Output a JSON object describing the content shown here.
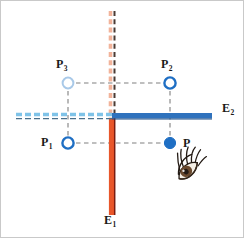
{
  "figure": {
    "background_color": "#ffffff",
    "width": 244,
    "height": 238
  },
  "colors": {
    "mirror_vertical_solid": "#e8562a",
    "mirror_vertical_dashed": "#f2b39a",
    "mirror_vertical_edge": "#7a1c10",
    "mirror_horizontal_solid": "#2f72bd",
    "mirror_horizontal_dashed": "#7fc3e8",
    "point_strong": "#1f6fc4",
    "point_faded": "#a9c9e8",
    "construction_line": "#808080",
    "label_text": "#1a1a1a",
    "eye_iris": "#6b4a2f",
    "eye_lash": "#231a14"
  },
  "mirrors": [
    {
      "id": "E1",
      "label": "E",
      "subscript": "1",
      "orientation": "vertical",
      "solid_segment": "below junction",
      "dashed_extension": "above junction"
    },
    {
      "id": "E2",
      "label": "E",
      "subscript": "2",
      "orientation": "horizontal",
      "solid_segment": "right of junction",
      "dashed_extension": "left of junction"
    }
  ],
  "points": [
    {
      "id": "P",
      "label": "P",
      "subscript": "",
      "style": "filled",
      "color": "#1f6fc4",
      "x": 169,
      "y": 142,
      "label_x": 182,
      "label_y": 136,
      "quadrant": "lower-right (object)"
    },
    {
      "id": "P1",
      "label": "P",
      "subscript": "1",
      "style": "open",
      "color": "#1f6fc4",
      "x": 67,
      "y": 142,
      "label_x": 42,
      "label_y": 136,
      "quadrant": "lower-left"
    },
    {
      "id": "P2",
      "label": "P",
      "subscript": "2",
      "style": "open",
      "color": "#1f6fc4",
      "x": 169,
      "y": 82,
      "label_x": 160,
      "label_y": 59,
      "quadrant": "upper-right"
    },
    {
      "id": "P3",
      "label": "P",
      "subscript": "3",
      "style": "open-faded",
      "color": "#a9c9e8",
      "x": 67,
      "y": 82,
      "label_x": 57,
      "label_y": 59,
      "quadrant": "upper-left"
    }
  ],
  "construction_lines": [
    {
      "from": "P",
      "to": "P1",
      "style": "dashed",
      "orientation": "horizontal"
    },
    {
      "from": "P",
      "to": "P2",
      "style": "dashed",
      "orientation": "vertical"
    },
    {
      "from": "P1",
      "to": "P3",
      "style": "dashed",
      "orientation": "vertical"
    },
    {
      "from": "P3",
      "to": "P2",
      "style": "dashed",
      "orientation": "horizontal"
    }
  ],
  "observer": {
    "id": "eye",
    "icon": "eye-icon",
    "x": 190,
    "y": 172,
    "description": "observer eye looking up-left toward mirrors"
  },
  "labels": {
    "E1": {
      "text": "E",
      "sub": "1",
      "x": 107,
      "y": 219
    },
    "E2": {
      "text": "E",
      "sub": "2",
      "x": 222,
      "y": 106
    },
    "P": {
      "text": "P",
      "sub": "",
      "x": 182,
      "y": 136
    },
    "P1": {
      "text": "P",
      "sub": "1",
      "x": 40,
      "y": 135
    },
    "P2": {
      "text": "P",
      "sub": "2",
      "x": 160,
      "y": 58
    },
    "P3": {
      "text": "P",
      "sub": "3",
      "x": 56,
      "y": 58
    }
  }
}
